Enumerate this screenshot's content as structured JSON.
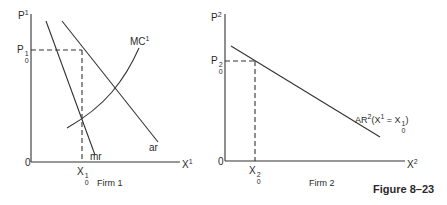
{
  "figure_label": "Figure 8–23",
  "panels": [
    {
      "caption": "Firm 1",
      "y_axis": {
        "symbol": "P",
        "sup": "1"
      },
      "x_axis": {
        "symbol": "X",
        "sup": "1"
      },
      "origin": "0",
      "price_level": {
        "symbol": "P",
        "sup": "1",
        "sub": "0"
      },
      "quantity_level": {
        "symbol": "X",
        "sup": "1",
        "sub": "0"
      },
      "curves": [
        {
          "name": "MC",
          "sup": "1"
        },
        {
          "name": "mr"
        },
        {
          "name": "ar"
        }
      ]
    },
    {
      "caption": "Firm 2",
      "y_axis": {
        "symbol": "P",
        "sup": "2"
      },
      "x_axis": {
        "symbol": "X",
        "sup": "2"
      },
      "origin": "0",
      "price_level": {
        "symbol": "P",
        "sup": "2",
        "sub": "0"
      },
      "quantity_level": {
        "symbol": "X",
        "sup": "2",
        "sub": "0"
      },
      "curves": [
        {
          "name": "AR",
          "sup": "2",
          "condition": "(X",
          "condition_sup": "1",
          "condition_eq": " = X",
          "condition_sup2": "1",
          "condition_sub2": "0",
          "condition_close": ")"
        }
      ]
    }
  ]
}
